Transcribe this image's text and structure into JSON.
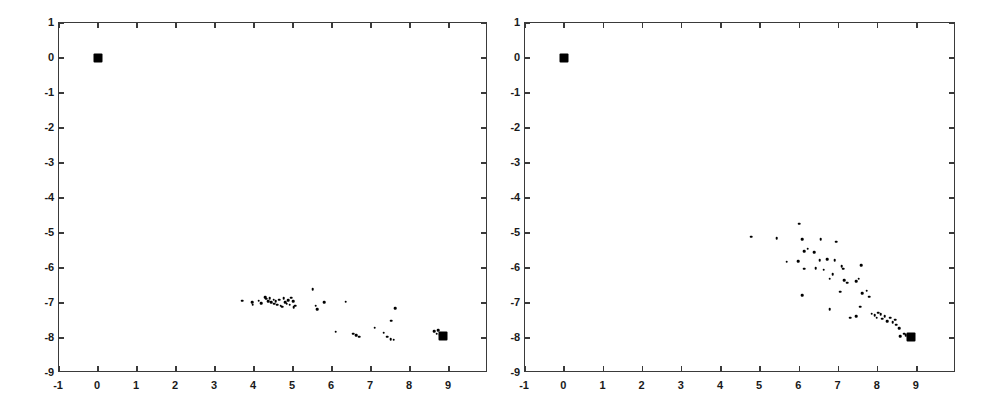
{
  "figure": {
    "background_color": "#ffffff",
    "ink_color": "#000000",
    "axis_color": "#3a3a3a",
    "width": 997,
    "height": 405
  },
  "chart_data": [
    {
      "type": "scatter",
      "panel": "left",
      "title": "",
      "xlabel": "",
      "ylabel": "",
      "xlim": [
        -1,
        10
      ],
      "ylim": [
        -9,
        1
      ],
      "xticks": [
        -1,
        0,
        1,
        2,
        3,
        4,
        5,
        6,
        7,
        8,
        9,
        10
      ],
      "yticks": [
        1,
        0,
        -1,
        -2,
        -3,
        -4,
        -5,
        -6,
        -7,
        -8,
        -9
      ],
      "xticklabels": [
        "-1",
        "0",
        "1",
        "2",
        "3",
        "4",
        "5",
        "6",
        "7",
        "8",
        "9",
        ""
      ],
      "yticklabels": [
        "1",
        "0",
        "-1",
        "-2",
        "-3",
        "-4",
        "-5",
        "-6",
        "-7",
        "-8",
        "-9"
      ],
      "grid": false,
      "legend": null,
      "series": [
        {
          "name": "endpoints",
          "marker": "filled-square",
          "marker_size": 9,
          "points": [
            [
              0.0,
              0.0
            ],
            [
              8.85,
              -7.95
            ]
          ]
        },
        {
          "name": "samples",
          "marker": "dot",
          "marker_size": 2.6,
          "points": [
            [
              3.7,
              -6.93
            ],
            [
              3.95,
              -6.97
            ],
            [
              3.97,
              -7.05
            ],
            [
              4.12,
              -6.93
            ],
            [
              4.18,
              -7.0
            ],
            [
              4.28,
              -6.83
            ],
            [
              4.32,
              -6.88
            ],
            [
              4.36,
              -6.95
            ],
            [
              4.4,
              -6.87
            ],
            [
              4.44,
              -6.98
            ],
            [
              4.5,
              -6.9
            ],
            [
              4.52,
              -7.02
            ],
            [
              4.56,
              -6.95
            ],
            [
              4.6,
              -7.05
            ],
            [
              4.64,
              -6.9
            ],
            [
              4.68,
              -7.08
            ],
            [
              4.72,
              -7.1
            ],
            [
              4.76,
              -6.86
            ],
            [
              4.8,
              -6.97
            ],
            [
              4.84,
              -7.02
            ],
            [
              4.88,
              -6.92
            ],
            [
              4.92,
              -7.05
            ],
            [
              4.96,
              -6.85
            ],
            [
              5.0,
              -6.95
            ],
            [
              5.02,
              -7.12
            ],
            [
              5.05,
              -7.08
            ],
            [
              5.5,
              -6.6
            ],
            [
              5.58,
              -7.08
            ],
            [
              5.62,
              -7.18
            ],
            [
              5.8,
              -6.97
            ],
            [
              6.35,
              -6.96
            ],
            [
              6.1,
              -7.82
            ],
            [
              6.55,
              -7.88
            ],
            [
              6.62,
              -7.92
            ],
            [
              6.7,
              -7.96
            ],
            [
              7.1,
              -7.7
            ],
            [
              7.33,
              -7.85
            ],
            [
              7.42,
              -7.96
            ],
            [
              7.5,
              -8.03
            ],
            [
              7.58,
              -8.05
            ],
            [
              7.52,
              -7.5
            ],
            [
              7.62,
              -7.15
            ],
            [
              8.62,
              -7.8
            ],
            [
              8.68,
              -7.88
            ],
            [
              8.72,
              -7.78
            ],
            [
              8.78,
              -7.9
            ]
          ]
        }
      ]
    },
    {
      "type": "scatter",
      "panel": "right",
      "title": "",
      "xlabel": "",
      "ylabel": "",
      "xlim": [
        -1,
        10
      ],
      "ylim": [
        -9,
        1
      ],
      "xticks": [
        -1,
        0,
        1,
        2,
        3,
        4,
        5,
        6,
        7,
        8,
        9,
        10
      ],
      "yticks": [
        1,
        0,
        -1,
        -2,
        -3,
        -4,
        -5,
        -6,
        -7,
        -8,
        -9
      ],
      "xticklabels": [
        "-1",
        "0",
        "1",
        "2",
        "3",
        "4",
        "5",
        "6",
        "7",
        "8",
        "9",
        ""
      ],
      "yticklabels": [
        "1",
        "0",
        "-1",
        "-2",
        "-3",
        "-4",
        "-5",
        "-6",
        "-7",
        "-8",
        "-9"
      ],
      "grid": false,
      "legend": null,
      "series": [
        {
          "name": "endpoints",
          "marker": "filled-square",
          "marker_size": 9,
          "points": [
            [
              0.0,
              0.0
            ],
            [
              8.85,
              -7.98
            ]
          ]
        },
        {
          "name": "samples",
          "marker": "dot",
          "marker_size": 2.6,
          "points": [
            [
              4.78,
              -5.1
            ],
            [
              5.42,
              -5.15
            ],
            [
              6.0,
              -4.73
            ],
            [
              6.08,
              -5.18
            ],
            [
              6.12,
              -5.52
            ],
            [
              6.22,
              -5.45
            ],
            [
              6.38,
              -5.55
            ],
            [
              6.55,
              -5.18
            ],
            [
              6.52,
              -5.78
            ],
            [
              6.72,
              -5.75
            ],
            [
              6.95,
              -5.25
            ],
            [
              6.9,
              -5.78
            ],
            [
              5.68,
              -5.82
            ],
            [
              5.98,
              -5.8
            ],
            [
              6.12,
              -6.02
            ],
            [
              6.42,
              -6.0
            ],
            [
              6.62,
              -6.05
            ],
            [
              6.78,
              -6.3
            ],
            [
              6.85,
              -6.18
            ],
            [
              7.08,
              -5.95
            ],
            [
              7.12,
              -6.02
            ],
            [
              7.15,
              -6.35
            ],
            [
              7.22,
              -6.42
            ],
            [
              7.45,
              -6.38
            ],
            [
              7.52,
              -6.3
            ],
            [
              7.58,
              -5.92
            ],
            [
              7.6,
              -6.72
            ],
            [
              7.55,
              -7.1
            ],
            [
              7.72,
              -6.65
            ],
            [
              7.78,
              -6.82
            ],
            [
              6.08,
              -6.78
            ],
            [
              6.78,
              -7.18
            ],
            [
              7.05,
              -6.68
            ],
            [
              7.3,
              -7.42
            ],
            [
              7.45,
              -7.38
            ],
            [
              7.85,
              -7.3
            ],
            [
              7.92,
              -7.35
            ],
            [
              7.98,
              -7.42
            ],
            [
              8.02,
              -7.28
            ],
            [
              8.08,
              -7.32
            ],
            [
              8.12,
              -7.45
            ],
            [
              8.18,
              -7.38
            ],
            [
              8.25,
              -7.52
            ],
            [
              8.32,
              -7.42
            ],
            [
              8.38,
              -7.55
            ],
            [
              8.45,
              -7.48
            ],
            [
              8.48,
              -7.62
            ],
            [
              8.55,
              -7.72
            ],
            [
              8.58,
              -7.95
            ],
            [
              8.68,
              -7.88
            ],
            [
              8.72,
              -7.92
            ],
            [
              8.78,
              -7.96
            ]
          ]
        }
      ]
    }
  ]
}
